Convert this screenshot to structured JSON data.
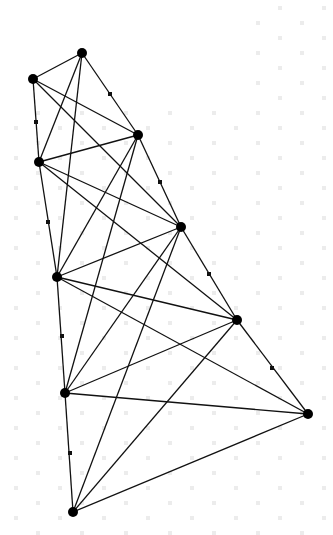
{
  "diagram": {
    "type": "graph",
    "background": "#ffffff",
    "watermark_color": "#e8e8e8",
    "edge_color": "#111111",
    "node_color": "#000000",
    "nodes": [
      {
        "id": "A",
        "x": 82,
        "y": 53
      },
      {
        "id": "B",
        "x": 33,
        "y": 79
      },
      {
        "id": "C",
        "x": 138,
        "y": 135
      },
      {
        "id": "D",
        "x": 39,
        "y": 162
      },
      {
        "id": "E",
        "x": 181,
        "y": 227
      },
      {
        "id": "F",
        "x": 57,
        "y": 277
      },
      {
        "id": "G",
        "x": 237,
        "y": 320
      },
      {
        "id": "H",
        "x": 65,
        "y": 393
      },
      {
        "id": "I",
        "x": 308,
        "y": 414
      },
      {
        "id": "J",
        "x": 73,
        "y": 512
      }
    ],
    "waypoints": [
      {
        "edge": "A-C",
        "x": 110,
        "y": 94
      },
      {
        "edge": "B-D",
        "x": 36,
        "y": 122
      },
      {
        "edge": "C-E",
        "x": 160,
        "y": 182
      },
      {
        "edge": "D-F",
        "x": 48,
        "y": 222
      },
      {
        "edge": "E-G",
        "x": 209,
        "y": 274
      },
      {
        "edge": "F-H",
        "x": 62,
        "y": 336
      },
      {
        "edge": "G-I",
        "x": 272,
        "y": 368
      },
      {
        "edge": "H-J",
        "x": 70,
        "y": 453
      }
    ],
    "edges": [
      [
        "A",
        "B"
      ],
      [
        "A",
        "C"
      ],
      [
        "A",
        "D"
      ],
      [
        "A",
        "F"
      ],
      [
        "B",
        "C"
      ],
      [
        "B",
        "D"
      ],
      [
        "B",
        "E"
      ],
      [
        "C",
        "D"
      ],
      [
        "C",
        "E"
      ],
      [
        "C",
        "F"
      ],
      [
        "C",
        "H"
      ],
      [
        "D",
        "E"
      ],
      [
        "D",
        "F"
      ],
      [
        "D",
        "G"
      ],
      [
        "E",
        "F"
      ],
      [
        "E",
        "G"
      ],
      [
        "E",
        "H"
      ],
      [
        "E",
        "J"
      ],
      [
        "F",
        "G"
      ],
      [
        "F",
        "H"
      ],
      [
        "F",
        "I"
      ],
      [
        "G",
        "H"
      ],
      [
        "G",
        "I"
      ],
      [
        "G",
        "J"
      ],
      [
        "H",
        "I"
      ],
      [
        "H",
        "J"
      ],
      [
        "I",
        "J"
      ]
    ]
  }
}
